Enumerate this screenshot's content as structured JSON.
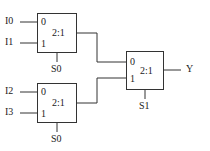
{
  "diagram": {
    "inputs": [
      {
        "label": "I0"
      },
      {
        "label": "I1"
      },
      {
        "label": "I2"
      },
      {
        "label": "I3"
      }
    ],
    "muxes": [
      {
        "ratio": "2:1",
        "in0": "0",
        "in1": "1",
        "select": "S0"
      },
      {
        "ratio": "2:1",
        "in0": "0",
        "in1": "1",
        "select": "S0"
      },
      {
        "ratio": "2:1",
        "in0": "0",
        "in1": "1",
        "select": "S1"
      }
    ],
    "output": {
      "label": "Y"
    },
    "colors": {
      "line": "#333333",
      "text": "#222222"
    }
  }
}
